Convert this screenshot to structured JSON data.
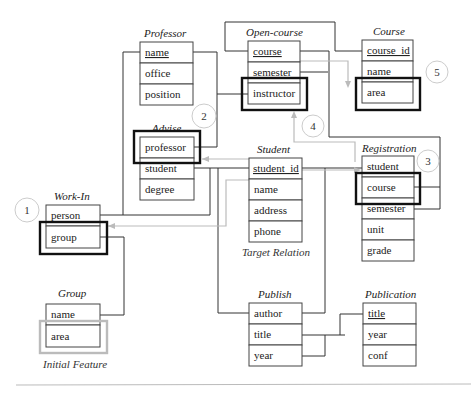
{
  "diagram": {
    "tables": {
      "professor": {
        "title": "Professor",
        "fields": [
          "name",
          "office",
          "position"
        ],
        "key": "name"
      },
      "open_course": {
        "title": "Open-course",
        "fields": [
          "course",
          "semester",
          "instructor"
        ],
        "key": "course"
      },
      "course": {
        "title": "Course",
        "fields": [
          "course_id",
          "name",
          "area"
        ],
        "key": "course_id"
      },
      "advise": {
        "title": "Advise",
        "fields": [
          "professor",
          "student",
          "degree"
        ]
      },
      "student": {
        "title": "Student",
        "fields": [
          "student_id",
          "name",
          "address",
          "phone"
        ],
        "key": "student_id",
        "caption": "Target Relation"
      },
      "registration": {
        "title": "Registration",
        "fields": [
          "student",
          "course",
          "semester",
          "unit",
          "grade"
        ]
      },
      "work_in": {
        "title": "Work-In",
        "fields": [
          "person",
          "group"
        ]
      },
      "group": {
        "title": "Group",
        "fields": [
          "name",
          "area"
        ],
        "caption": "Initial Feature"
      },
      "publish": {
        "title": "Publish",
        "fields": [
          "author",
          "title",
          "year"
        ]
      },
      "publication": {
        "title": "Publication",
        "fields": [
          "title",
          "year",
          "conf"
        ],
        "key": "title"
      }
    },
    "step_labels": [
      "1",
      "2",
      "3",
      "4",
      "5"
    ],
    "highlighted": [
      {
        "table": "work_in",
        "field": "group",
        "step": "1"
      },
      {
        "table": "advise",
        "field": "professor",
        "step": "2"
      },
      {
        "table": "registration",
        "field": "course",
        "step": "3"
      },
      {
        "table": "open_course",
        "field": "instructor",
        "step": "4"
      },
      {
        "table": "course",
        "field": "area",
        "step": "5"
      }
    ],
    "initial_feature": {
      "table": "group",
      "field": "area"
    },
    "colors": {
      "line": "#333333",
      "highlight": "#111111",
      "propagation": "#bbbbbb"
    }
  }
}
